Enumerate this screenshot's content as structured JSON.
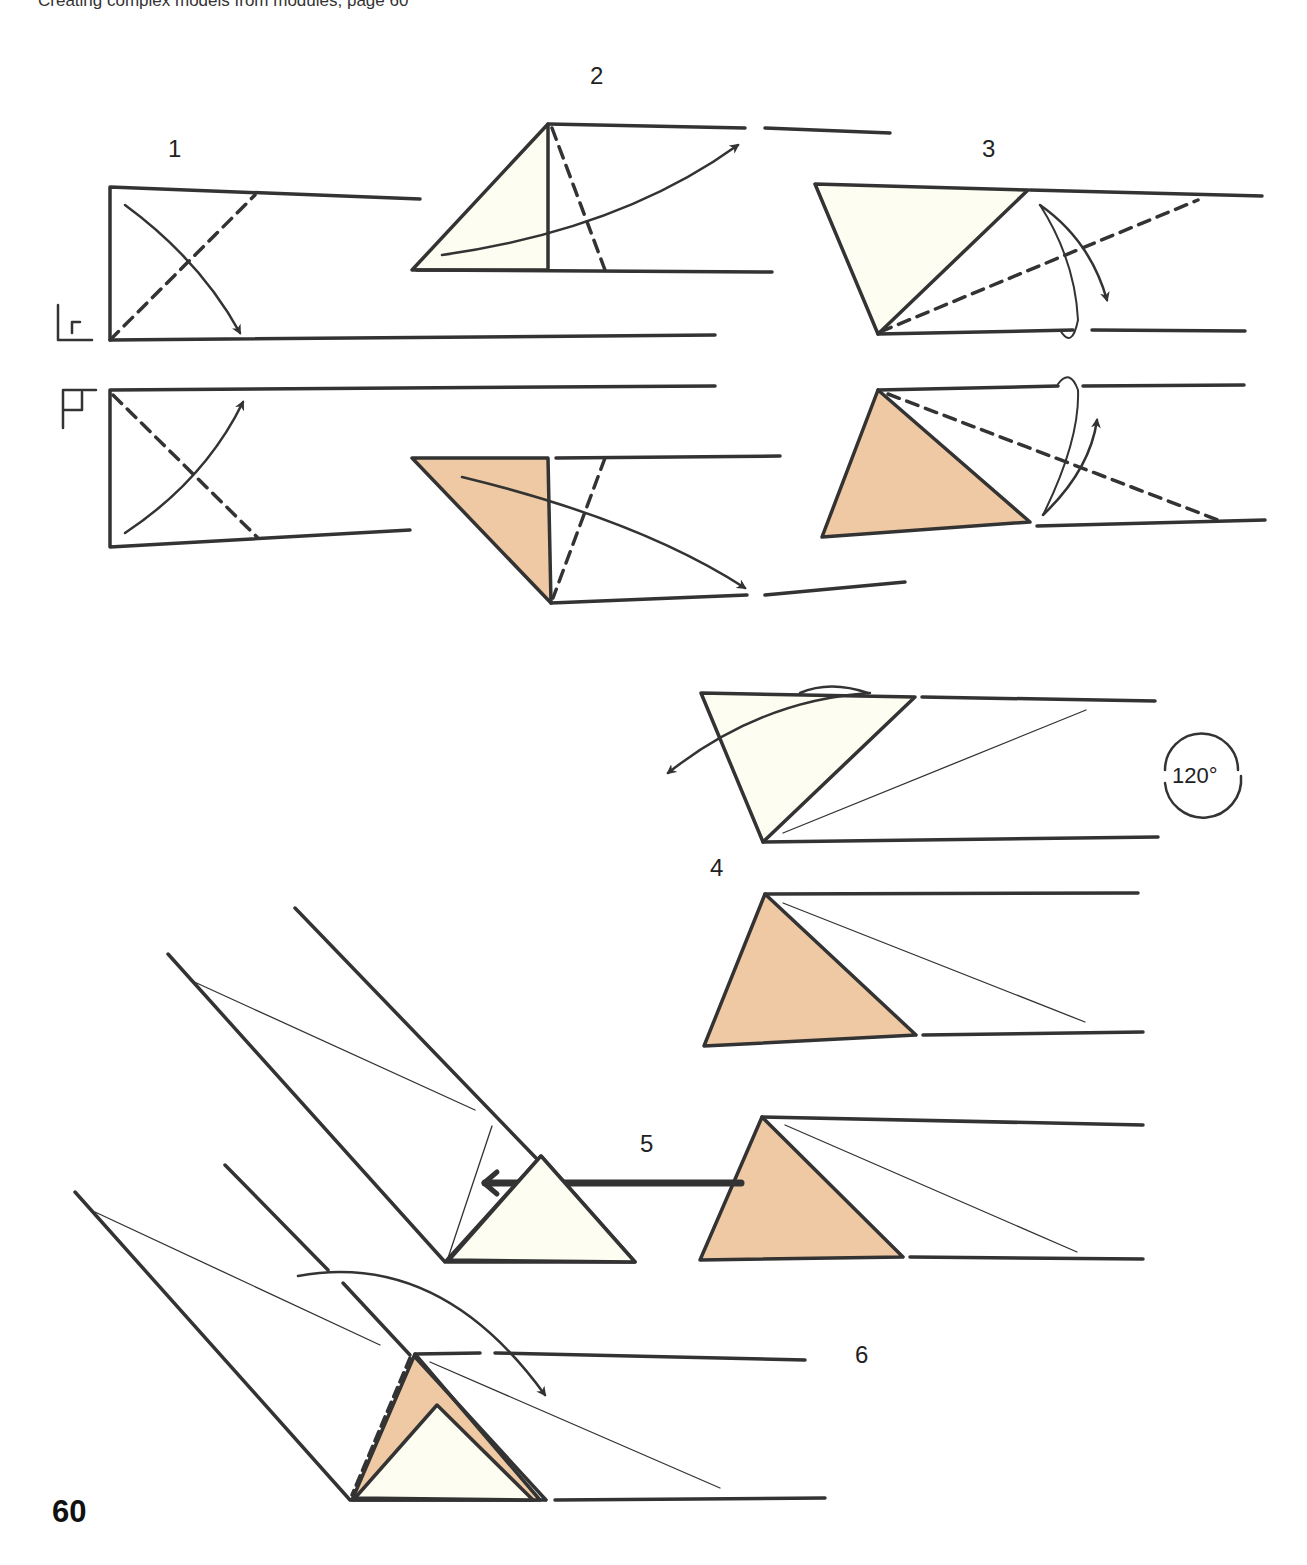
{
  "header": {
    "text": "Creating complex models from modules, page 60"
  },
  "steps": [
    {
      "label": "1"
    },
    {
      "label": "2"
    },
    {
      "label": "3"
    },
    {
      "label": "4"
    },
    {
      "label": "5"
    },
    {
      "label": "6"
    }
  ],
  "rotation": {
    "label": "120°"
  },
  "page_number": "60",
  "colors": {
    "line": "#333333",
    "front_fill": "#fefdf1",
    "back_fill": "#eec9a4"
  }
}
